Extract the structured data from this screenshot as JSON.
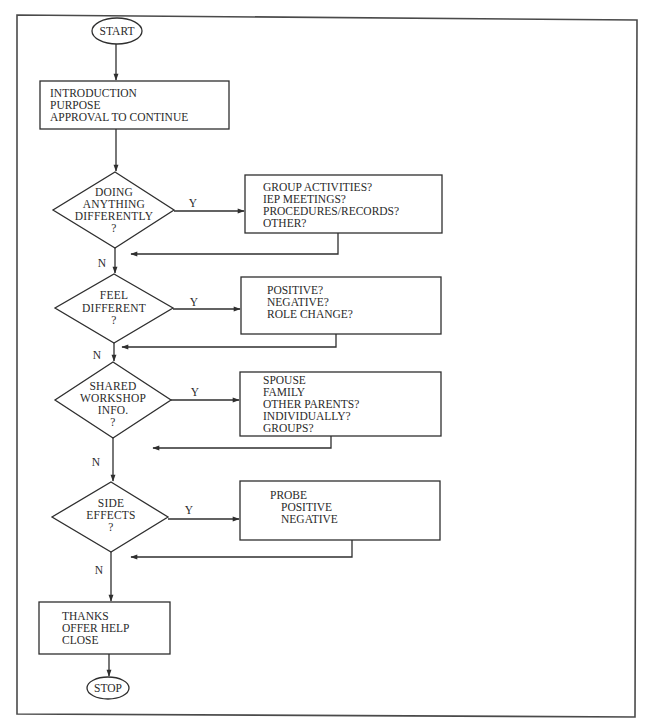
{
  "flowchart": {
    "start": {
      "label": "START"
    },
    "stop": {
      "label": "STOP"
    },
    "intro_box": {
      "lines": [
        "INTRODUCTION",
        "PURPOSE",
        "APPROVAL TO CONTINUE"
      ]
    },
    "decisions": [
      {
        "lines": [
          "DOING",
          "ANYTHING",
          "DIFFERENTLY",
          "?"
        ],
        "yes_label": "Y",
        "no_label": "N",
        "yes_box": {
          "lines": [
            "GROUP ACTIVITIES?",
            "IEP MEETINGS?",
            "PROCEDURES/RECORDS?",
            "OTHER?"
          ]
        }
      },
      {
        "lines": [
          "FEEL",
          "DIFFERENT",
          "?"
        ],
        "yes_label": "Y",
        "no_label": "N",
        "yes_box": {
          "lines": [
            "POSITIVE?",
            "NEGATIVE?",
            "ROLE CHANGE?"
          ]
        }
      },
      {
        "lines": [
          "SHARED",
          "WORKSHOP",
          "INFO.",
          "?"
        ],
        "yes_label": "Y",
        "no_label": "N",
        "yes_box": {
          "lines": [
            "SPOUSE",
            "FAMILY",
            "OTHER PARENTS?",
            "INDIVIDUALLY?",
            "GROUPS?"
          ]
        }
      },
      {
        "lines": [
          "SIDE",
          "EFFECTS",
          "?"
        ],
        "yes_label": "Y",
        "no_label": "N",
        "yes_box": {
          "lines": [
            "PROBE",
            "POSITIVE",
            "NEGATIVE"
          ]
        }
      }
    ],
    "end_box": {
      "lines": [
        "THANKS",
        "OFFER HELP",
        "CLOSE"
      ]
    }
  },
  "colors": {
    "line": "#2f2f2f",
    "text": "#2a2a2a",
    "background": "#ffffff"
  }
}
